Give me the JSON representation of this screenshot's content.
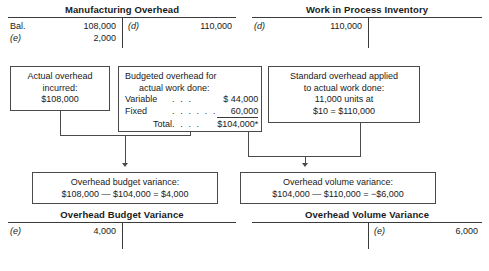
{
  "accounts": {
    "manufacturing_overhead": {
      "title": "Manufacturing Overhead",
      "debit_rows": [
        {
          "ref": "Bal.",
          "amount": "108,000"
        },
        {
          "ref": "(e)",
          "amount": "2,000"
        }
      ],
      "credit_rows": [
        {
          "ref": "(d)",
          "amount": "110,000"
        }
      ]
    },
    "work_in_process": {
      "title": "Work in Process Inventory",
      "debit_rows": [
        {
          "ref": "(d)",
          "amount": "110,000"
        }
      ],
      "credit_rows": []
    },
    "overhead_budget_variance": {
      "title": "Overhead Budget Variance",
      "debit_rows": [
        {
          "ref": "(e)",
          "amount": "4,000"
        }
      ],
      "credit_rows": []
    },
    "overhead_volume_variance": {
      "title": "Overhead Volume Variance",
      "debit_rows": [],
      "credit_rows": [
        {
          "ref": "(e)",
          "amount": "6,000"
        }
      ]
    }
  },
  "boxes": {
    "actual_overhead": {
      "line1": "Actual overhead",
      "line2": "incurred:",
      "line3": "$108,000"
    },
    "budgeted_overhead": {
      "heading1": "Budgeted overhead for",
      "heading2": "actual work done:",
      "rows": [
        {
          "label": "Variable",
          "leader": ". . .",
          "amount": "$ 44,000"
        },
        {
          "label": "Fixed",
          "leader": ". . . . . .",
          "amount": "60,000"
        }
      ],
      "total_label": "Total",
      "total_leader": ". . . .",
      "total_amount": "$104,000*"
    },
    "standard_applied": {
      "line1": "Standard overhead applied",
      "line2": "to actual work done:",
      "line3": "11,000 units at",
      "line4": "$10 = $110,000"
    },
    "budget_variance": {
      "title": "Overhead budget variance:",
      "formula": "$108,000 — $104,000 = $4,000"
    },
    "volume_variance": {
      "title": "Overhead volume variance:",
      "formula": "$104,000 — $110,000 = −$6,000"
    }
  }
}
